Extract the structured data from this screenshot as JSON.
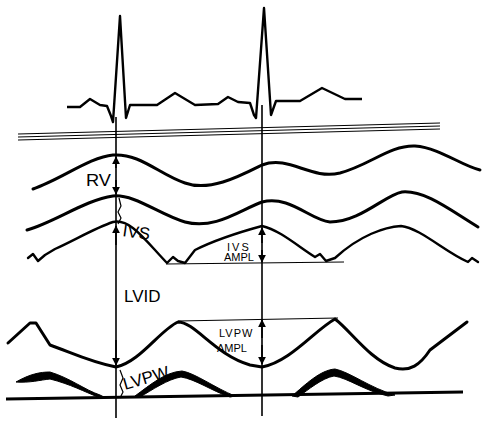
{
  "diagram": {
    "type": "M-mode echocardiogram schematic",
    "colors": {
      "ink": "#000000",
      "background": "#ffffff"
    },
    "traces": [
      {
        "id": "ecg",
        "name": "ECG trace"
      },
      {
        "id": "chest-wall",
        "name": "Chest wall echo lines"
      },
      {
        "id": "rv-wall",
        "name": "Right ventricular anterior wall"
      },
      {
        "id": "ivs-right",
        "name": "Interventricular septum right side"
      },
      {
        "id": "ivs-left",
        "name": "Interventricular septum left side"
      },
      {
        "id": "lvpw-endo",
        "name": "LV posterior wall endocardium"
      },
      {
        "id": "lvpw-epi",
        "name": "LV posterior wall epicardium"
      },
      {
        "id": "pericardium",
        "name": "Pericardium baseline"
      }
    ],
    "labels": {
      "rv": "RV",
      "ivs": "IVS",
      "lvid": "LVID",
      "lvpw": "LVPW",
      "ivs_ampl_line1": "IVS",
      "ivs_ampl_line2": "AMPL",
      "lvpw_ampl_line1": "LVPW",
      "lvpw_ampl_line2": "AMPL"
    },
    "markers": [
      {
        "id": "end-diastole",
        "name": "Vertical line at ECG R-wave (end-diastole)",
        "x": 116
      },
      {
        "id": "end-systole",
        "name": "Vertical line at second R-wave",
        "x": 262
      }
    ]
  }
}
